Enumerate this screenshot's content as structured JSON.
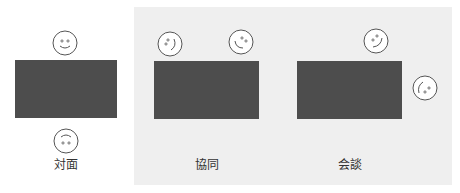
{
  "colors": {
    "panel_background": "#efefef",
    "table_fill": "#4d4d4d",
    "face_stroke": "#555555",
    "label_text": "#333333"
  },
  "scenes": [
    {
      "id": "face-to-face",
      "label": "対面",
      "people": 2
    },
    {
      "id": "cooperation",
      "label": "協同",
      "people": 2
    },
    {
      "id": "conversation",
      "label": "会談",
      "people": 2
    }
  ]
}
